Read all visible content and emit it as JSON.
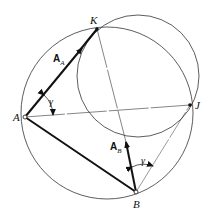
{
  "diagram": {
    "points": {
      "K": {
        "label": "K",
        "x": 97,
        "y": 29
      },
      "A": {
        "label": "A",
        "x": 25,
        "y": 117
      },
      "J": {
        "label": "J",
        "x": 190,
        "y": 105
      },
      "B": {
        "label": "B",
        "x": 136,
        "y": 192
      }
    },
    "vectors": {
      "A_A": {
        "label": "A",
        "sub": "A"
      },
      "A_B": {
        "label": "A",
        "sub": "B"
      }
    },
    "angles": {
      "gamma_A": "γ",
      "gamma_B": "γ"
    },
    "circles": [
      {
        "name": "large-circle",
        "cx": 107,
        "cy": 113,
        "r": 86
      },
      {
        "name": "small-circle",
        "cx": 138,
        "cy": 76,
        "r": 61
      }
    ],
    "colors": {
      "stroke": "#222222",
      "background": "#ffffff"
    }
  }
}
